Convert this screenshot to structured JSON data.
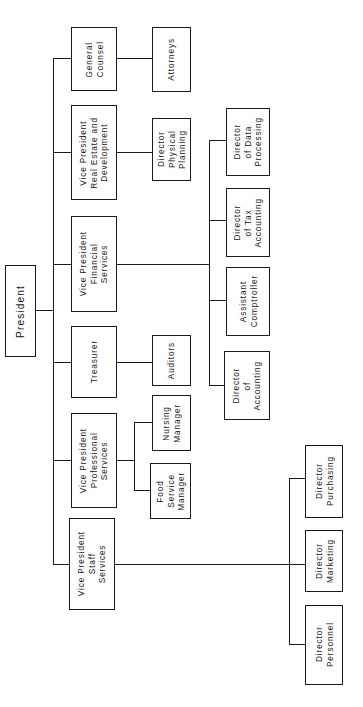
{
  "diagram": {
    "type": "organization-chart",
    "title": "President",
    "orientation": "rotated-90-counterclockwise",
    "line_color": "#1b1b1b",
    "box_fill": "#ffffff",
    "nodes": [
      {
        "id": "president",
        "label": "President",
        "level": 0,
        "x": 5,
        "y": 265,
        "w": 31,
        "h": 92
      },
      {
        "id": "general-counsel",
        "label": "General\nCounsel",
        "level": 1,
        "x": 71,
        "y": 27,
        "w": 46,
        "h": 64
      },
      {
        "id": "vp-real-estate",
        "label": "Vice President\nReal Estate and\nDevelopment",
        "level": 1,
        "x": 71,
        "y": 105,
        "w": 46,
        "h": 95
      },
      {
        "id": "vp-financial",
        "label": "Vice President\nFinancial\nServices",
        "level": 1,
        "x": 71,
        "y": 216,
        "w": 46,
        "h": 96
      },
      {
        "id": "treasurer",
        "label": "Treasurer",
        "level": 1,
        "x": 71,
        "y": 326,
        "w": 46,
        "h": 72
      },
      {
        "id": "vp-professional",
        "label": "Vice President\nProfessional\nServices",
        "level": 1,
        "x": 71,
        "y": 413,
        "w": 46,
        "h": 95
      },
      {
        "id": "vp-staff",
        "label": "Vice President\nStaff\nServices",
        "level": 1,
        "x": 69,
        "y": 518,
        "w": 46,
        "h": 92
      },
      {
        "id": "attorneys",
        "label": "Attorneys",
        "level": 2,
        "x": 152,
        "y": 27,
        "w": 39,
        "h": 65
      },
      {
        "id": "dir-physical",
        "label": "Director\nPhysical\nPlanning",
        "level": 2,
        "x": 152,
        "y": 118,
        "w": 39,
        "h": 63
      },
      {
        "id": "auditors",
        "label": "Auditors",
        "level": 2,
        "x": 152,
        "y": 335,
        "w": 39,
        "h": 51
      },
      {
        "id": "nursing-manager",
        "label": "Nursing\nManager",
        "level": 2,
        "x": 152,
        "y": 395,
        "w": 39,
        "h": 56
      },
      {
        "id": "food-service",
        "label": "Food\nService\nManager",
        "level": 2,
        "x": 150,
        "y": 463,
        "w": 41,
        "h": 56
      },
      {
        "id": "dir-data",
        "label": "Director\nof Data\nProcessing",
        "level": 2,
        "x": 226,
        "y": 108,
        "w": 44,
        "h": 68
      },
      {
        "id": "dir-tax",
        "label": "Director\nof Tax\nAccounting",
        "level": 2,
        "x": 226,
        "y": 188,
        "w": 44,
        "h": 69
      },
      {
        "id": "asst-comptroller",
        "label": "Assistant\nComptroller",
        "level": 2,
        "x": 226,
        "y": 267,
        "w": 44,
        "h": 69
      },
      {
        "id": "dir-accounting",
        "label": "Director\nof\nAccounting",
        "level": 2,
        "x": 224,
        "y": 351,
        "w": 46,
        "h": 69
      },
      {
        "id": "dir-purchasing",
        "label": "Director\nPurchasing",
        "level": 2,
        "x": 305,
        "y": 445,
        "w": 38,
        "h": 73
      },
      {
        "id": "dir-marketing",
        "label": "Director\nMarketing",
        "level": 2,
        "x": 305,
        "y": 530,
        "w": 38,
        "h": 62
      },
      {
        "id": "dir-personnel",
        "label": "Director\nPersonnel",
        "level": 2,
        "x": 305,
        "y": 605,
        "w": 38,
        "h": 80
      }
    ],
    "connectors": [
      {
        "id": "pres-stub",
        "orient": "h",
        "x": 36,
        "y": 310,
        "len": 17
      },
      {
        "id": "pres-bus",
        "orient": "v",
        "x": 53,
        "y": 58,
        "len": 507
      },
      {
        "id": "branch-counsel",
        "orient": "h",
        "x": 53,
        "y": 58,
        "len": 18
      },
      {
        "id": "branch-realestate",
        "orient": "h",
        "x": 53,
        "y": 152,
        "len": 18
      },
      {
        "id": "branch-financial",
        "orient": "h",
        "x": 53,
        "y": 264,
        "len": 18
      },
      {
        "id": "branch-treasurer",
        "orient": "h",
        "x": 53,
        "y": 362,
        "len": 18
      },
      {
        "id": "branch-prof",
        "orient": "h",
        "x": 53,
        "y": 460,
        "len": 18
      },
      {
        "id": "branch-staff",
        "orient": "h",
        "x": 53,
        "y": 564,
        "len": 16
      },
      {
        "id": "counsel-attorneys",
        "orient": "h",
        "x": 117,
        "y": 58,
        "len": 35
      },
      {
        "id": "realestate-phys",
        "orient": "h",
        "x": 117,
        "y": 152,
        "len": 35
      },
      {
        "id": "treasurer-aud",
        "orient": "h",
        "x": 117,
        "y": 362,
        "len": 35
      },
      {
        "id": "prof-stub",
        "orient": "h",
        "x": 117,
        "y": 460,
        "len": 18
      },
      {
        "id": "prof-bus",
        "orient": "v",
        "x": 134,
        "y": 422,
        "len": 69
      },
      {
        "id": "prof-nursing",
        "orient": "h",
        "x": 134,
        "y": 422,
        "len": 18
      },
      {
        "id": "prof-food",
        "orient": "h",
        "x": 134,
        "y": 490,
        "len": 16
      },
      {
        "id": "fin-stub",
        "orient": "h",
        "x": 117,
        "y": 264,
        "len": 92
      },
      {
        "id": "fin-bus",
        "orient": "v",
        "x": 209,
        "y": 140,
        "len": 246
      },
      {
        "id": "fin-data",
        "orient": "h",
        "x": 209,
        "y": 140,
        "len": 17
      },
      {
        "id": "fin-tax",
        "orient": "h",
        "x": 209,
        "y": 220,
        "len": 17
      },
      {
        "id": "fin-comptroller",
        "orient": "h",
        "x": 209,
        "y": 300,
        "len": 17
      },
      {
        "id": "fin-accounting",
        "orient": "h",
        "x": 209,
        "y": 385,
        "len": 15
      },
      {
        "id": "staff-stub",
        "orient": "h",
        "x": 115,
        "y": 564,
        "len": 175
      },
      {
        "id": "staff-bus",
        "orient": "v",
        "x": 289,
        "y": 478,
        "len": 167
      },
      {
        "id": "staff-purchasing",
        "orient": "h",
        "x": 289,
        "y": 478,
        "len": 16
      },
      {
        "id": "staff-marketing",
        "orient": "h",
        "x": 289,
        "y": 564,
        "len": 16
      },
      {
        "id": "staff-personnel",
        "orient": "h",
        "x": 289,
        "y": 644,
        "len": 16
      }
    ]
  }
}
